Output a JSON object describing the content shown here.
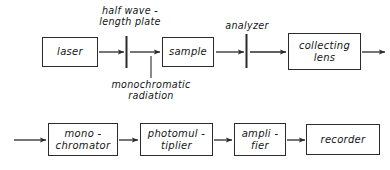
{
  "diagram": {
    "stroke_color": "#2b2b2b",
    "text_color": "#151515",
    "background": "#ffffff",
    "top_row": {
      "nodes": [
        {
          "id": "laser",
          "label": "laser"
        },
        {
          "id": "sample",
          "label": "sample"
        },
        {
          "id": "collecting-lens",
          "label": "collecting\nlens"
        }
      ],
      "optics": [
        {
          "id": "half-wave-plate",
          "label": "half wave -\nlength plate"
        },
        {
          "id": "analyzer",
          "label": "analyzer"
        }
      ]
    },
    "annotations": [
      {
        "id": "monochromatic-radiation",
        "label": "monochromatic\nradiation"
      }
    ],
    "bottom_row": {
      "nodes": [
        {
          "id": "monochromator",
          "label": "mono -\nchromator"
        },
        {
          "id": "photomultiplier",
          "label": "photomul -\ntiplier"
        },
        {
          "id": "amplifier",
          "label": "ampli -\nfier"
        },
        {
          "id": "recorder",
          "label": "recorder"
        }
      ]
    }
  }
}
